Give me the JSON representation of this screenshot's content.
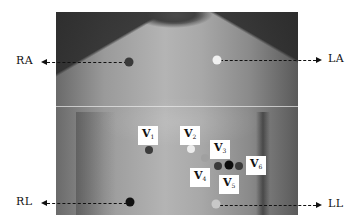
{
  "figure": {
    "type": "ECG electrode placement diagram",
    "limb_leads": [
      {
        "id": "RA",
        "label": "RA",
        "electrode_color": "#3a3a3a",
        "direction": "left"
      },
      {
        "id": "LA",
        "label": "LA",
        "electrode_color": "#f0f0f0",
        "direction": "right"
      },
      {
        "id": "RL",
        "label": "RL",
        "electrode_color": "#111111",
        "direction": "left"
      },
      {
        "id": "LL",
        "label": "LL",
        "electrode_color": "#c8c8c8",
        "direction": "right"
      }
    ],
    "chest_leads": [
      {
        "id": "V1",
        "main": "V",
        "sub": "1",
        "electrode_color": "#3c3c3c"
      },
      {
        "id": "V2",
        "main": "V",
        "sub": "2",
        "electrode_color": "#ececec"
      },
      {
        "id": "V3",
        "main": "V",
        "sub": "3",
        "electrode_color": "#a0a0a0"
      },
      {
        "id": "V4",
        "main": "V",
        "sub": "4",
        "electrode_color": "#3a3a3a"
      },
      {
        "id": "V5",
        "main": "V",
        "sub": "5",
        "electrode_color": "#0c0c0c"
      },
      {
        "id": "V6",
        "main": "V",
        "sub": "6",
        "electrode_color": "#3a3a3a"
      }
    ]
  }
}
